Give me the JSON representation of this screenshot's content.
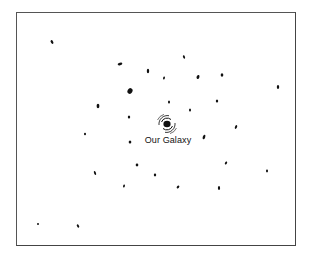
{
  "diagram": {
    "label": "Our Galaxy",
    "center": {
      "x": 167,
      "y": 124
    },
    "galaxies": [
      {
        "x": 52,
        "y": 42,
        "rx": 1.2,
        "ry": 2,
        "rot": -30
      },
      {
        "x": 120,
        "y": 64,
        "rx": 2.4,
        "ry": 1.2,
        "rot": -15
      },
      {
        "x": 148,
        "y": 71,
        "rx": 1.2,
        "ry": 2.2,
        "rot": 0
      },
      {
        "x": 164,
        "y": 78,
        "rx": 0.9,
        "ry": 1.6,
        "rot": 15
      },
      {
        "x": 198,
        "y": 77,
        "rx": 1.4,
        "ry": 2,
        "rot": 20
      },
      {
        "x": 222,
        "y": 75,
        "rx": 1.3,
        "ry": 1.8,
        "rot": 0
      },
      {
        "x": 184,
        "y": 57,
        "rx": 1,
        "ry": 1.8,
        "rot": -20
      },
      {
        "x": 130,
        "y": 91,
        "rx": 2.4,
        "ry": 3,
        "rot": 30
      },
      {
        "x": 98,
        "y": 106,
        "rx": 1.4,
        "ry": 2.2,
        "rot": 0
      },
      {
        "x": 169,
        "y": 102,
        "rx": 1,
        "ry": 1.6,
        "rot": 0
      },
      {
        "x": 217,
        "y": 101,
        "rx": 1.2,
        "ry": 1.5,
        "rot": 0
      },
      {
        "x": 190,
        "y": 110,
        "rx": 1,
        "ry": 1.6,
        "rot": 0
      },
      {
        "x": 129,
        "y": 117,
        "rx": 1.2,
        "ry": 1.5,
        "rot": 0
      },
      {
        "x": 278,
        "y": 87,
        "rx": 1.2,
        "ry": 2,
        "rot": 0
      },
      {
        "x": 236,
        "y": 127,
        "rx": 1,
        "ry": 2,
        "rot": 25
      },
      {
        "x": 85,
        "y": 134,
        "rx": 1,
        "ry": 1.3,
        "rot": 0
      },
      {
        "x": 130,
        "y": 142,
        "rx": 1.3,
        "ry": 1.5,
        "rot": 0
      },
      {
        "x": 204,
        "y": 137,
        "rx": 1.2,
        "ry": 2.4,
        "rot": 20
      },
      {
        "x": 137,
        "y": 165,
        "rx": 1.3,
        "ry": 1.4,
        "rot": 0
      },
      {
        "x": 226,
        "y": 163,
        "rx": 1,
        "ry": 1.6,
        "rot": 30
      },
      {
        "x": 95,
        "y": 173,
        "rx": 1,
        "ry": 2,
        "rot": -20
      },
      {
        "x": 155,
        "y": 175,
        "rx": 1.2,
        "ry": 1.4,
        "rot": 0
      },
      {
        "x": 267,
        "y": 171,
        "rx": 1,
        "ry": 1.4,
        "rot": 0
      },
      {
        "x": 124,
        "y": 186,
        "rx": 0.9,
        "ry": 1.6,
        "rot": 15
      },
      {
        "x": 178,
        "y": 187,
        "rx": 1.1,
        "ry": 1.6,
        "rot": 40
      },
      {
        "x": 219,
        "y": 188,
        "rx": 1.1,
        "ry": 2,
        "rot": 0
      },
      {
        "x": 38,
        "y": 224,
        "rx": 1,
        "ry": 1,
        "rot": 0
      },
      {
        "x": 78,
        "y": 226,
        "rx": 1,
        "ry": 1.8,
        "rot": -30
      }
    ]
  }
}
